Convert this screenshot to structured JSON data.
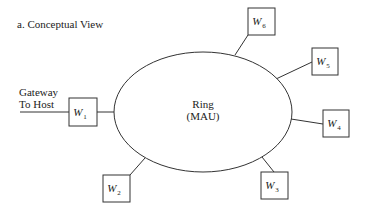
{
  "title": "a. Conceptual View",
  "gateway": {
    "line1": "Gateway",
    "line2": "To Host"
  },
  "ring": {
    "line1": "Ring",
    "line2": "(MAU)"
  },
  "colors": {
    "stroke": "#333333",
    "text": "#222222",
    "background": "#ffffff"
  },
  "nodes": [
    {
      "id": "W1",
      "label": "W",
      "sub": "1"
    },
    {
      "id": "W2",
      "label": "W",
      "sub": "2"
    },
    {
      "id": "W3",
      "label": "W",
      "sub": "3"
    },
    {
      "id": "W4",
      "label": "W",
      "sub": "4"
    },
    {
      "id": "W5",
      "label": "W",
      "sub": "5"
    },
    {
      "id": "W6",
      "label": "W",
      "sub": "6"
    }
  ]
}
